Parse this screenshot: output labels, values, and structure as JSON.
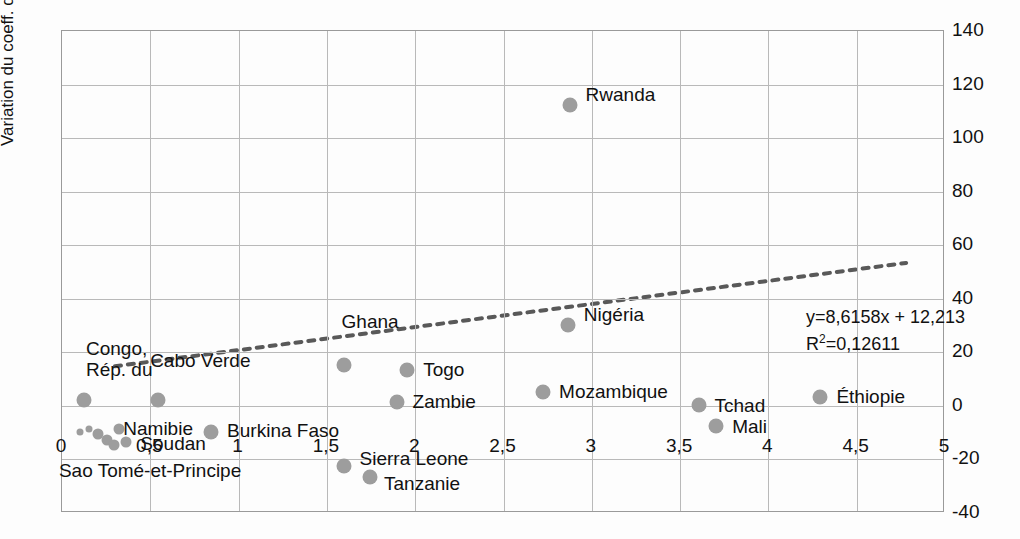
{
  "chart_data": {
    "type": "scatter",
    "title": "",
    "xlabel": "",
    "ylabel": "Variation du coeff. de Gini (%)",
    "xlim": [
      0,
      5
    ],
    "ylim": [
      -40,
      140
    ],
    "xticks": [
      "0",
      "0,5",
      "1",
      "1,5",
      "2",
      "2,5",
      "3",
      "3,5",
      "4",
      "4,5",
      "5"
    ],
    "xtick_values": [
      0,
      0.5,
      1,
      1.5,
      2,
      2.5,
      3,
      3.5,
      4,
      4.5,
      5
    ],
    "yticks": [
      "140",
      "120",
      "100",
      "80",
      "60",
      "40",
      "20",
      "0",
      "-20",
      "-40"
    ],
    "ytick_values": [
      140,
      120,
      100,
      80,
      60,
      40,
      20,
      0,
      -20,
      -40
    ],
    "grid": true,
    "legend": "none",
    "marker_color": "#9d9d9d",
    "trendline": {
      "style": "dotted",
      "color": "#595959",
      "slope": 8.6158,
      "intercept": 12.213,
      "equation": "y=8,6158x + 12,213",
      "r_squared_label": "R",
      "r_squared_sup": "2",
      "r_squared_value": "=0,12611"
    },
    "points": [
      {
        "name": "Rwanda",
        "x": 2.88,
        "y": 112,
        "label": "Rwanda",
        "label_dx": 16,
        "label_dy": -11,
        "size": "normal"
      },
      {
        "name": "Nigéria",
        "x": 2.87,
        "y": 30,
        "label": "Nigéria",
        "label_dx": 16,
        "label_dy": -11,
        "size": "normal"
      },
      {
        "name": "Ghana",
        "x": 1.6,
        "y": 15,
        "label": "Ghana",
        "label_dx": -2,
        "label_dy": -44,
        "size": "normal"
      },
      {
        "name": "Togo",
        "x": 1.96,
        "y": 13,
        "label": "Togo",
        "label_dx": 16,
        "label_dy": -1,
        "size": "normal"
      },
      {
        "name": "Zambie",
        "x": 1.9,
        "y": 1,
        "label": "Zambie",
        "label_dx": 16,
        "label_dy": -1,
        "size": "normal"
      },
      {
        "name": "Mozambique",
        "x": 2.73,
        "y": 5,
        "label": "Mozambique",
        "label_dx": 16,
        "label_dy": -1,
        "size": "normal"
      },
      {
        "name": "Tchad",
        "x": 3.61,
        "y": 0,
        "label": "Tchad",
        "label_dx": 16,
        "label_dy": 0,
        "size": "normal"
      },
      {
        "name": "Mali",
        "x": 3.71,
        "y": -8,
        "label": "Mali",
        "label_dx": 16,
        "label_dy": 0,
        "size": "normal"
      },
      {
        "name": "Éthiopie",
        "x": 4.3,
        "y": 3,
        "label": "Éthiopie",
        "label_dx": 16,
        "label_dy": -1,
        "size": "normal"
      },
      {
        "name": "Congo, Rép. du",
        "x": 0.13,
        "y": 2,
        "label": "Congo,\nRép. du",
        "label_dx": 2,
        "label_dy": -52,
        "size": "normal"
      },
      {
        "name": "Cabo Verde",
        "x": 0.55,
        "y": 2,
        "label": "Cabo Verde",
        "label_dx": -8,
        "label_dy": -40,
        "size": "normal"
      },
      {
        "name": "Namibie",
        "x": 0.33,
        "y": -9,
        "label": "Namibie",
        "label_dx": 4,
        "label_dy": -1,
        "size": "small"
      },
      {
        "name": "Soudan",
        "x": 0.37,
        "y": -14,
        "label": "Soudan",
        "label_dx": 14,
        "label_dy": 1,
        "size": "small"
      },
      {
        "name": "Sao Tomé-et-Principe",
        "x": 0.26,
        "y": -13,
        "label": "Sao Tomé-et-Principe",
        "label_dx": -48,
        "label_dy": 30,
        "size": "small"
      },
      {
        "name": "cluster-a",
        "x": 0.21,
        "y": -11,
        "label": "",
        "label_dx": 0,
        "label_dy": 0,
        "size": "small"
      },
      {
        "name": "cluster-b",
        "x": 0.3,
        "y": -15,
        "label": "",
        "label_dx": 0,
        "label_dy": 0,
        "size": "small"
      },
      {
        "name": "cluster-c",
        "x": 0.16,
        "y": -9,
        "label": "",
        "label_dx": 0,
        "label_dy": 0,
        "size": "tiny"
      },
      {
        "name": "cluster-d",
        "x": 0.11,
        "y": -10,
        "label": "",
        "label_dx": 0,
        "label_dy": 0,
        "size": "tiny"
      },
      {
        "name": "Burkina Faso",
        "x": 0.85,
        "y": -10,
        "label": "Burkina Faso",
        "label_dx": 16,
        "label_dy": -2,
        "size": "normal"
      },
      {
        "name": "Sierra Leone",
        "x": 1.6,
        "y": -23,
        "label": "Sierra Leone",
        "label_dx": 16,
        "label_dy": -8,
        "size": "normal"
      },
      {
        "name": "Tanzanie",
        "x": 1.75,
        "y": -27,
        "label": "Tanzanie",
        "label_dx": 14,
        "label_dy": 6,
        "size": "normal"
      }
    ]
  }
}
